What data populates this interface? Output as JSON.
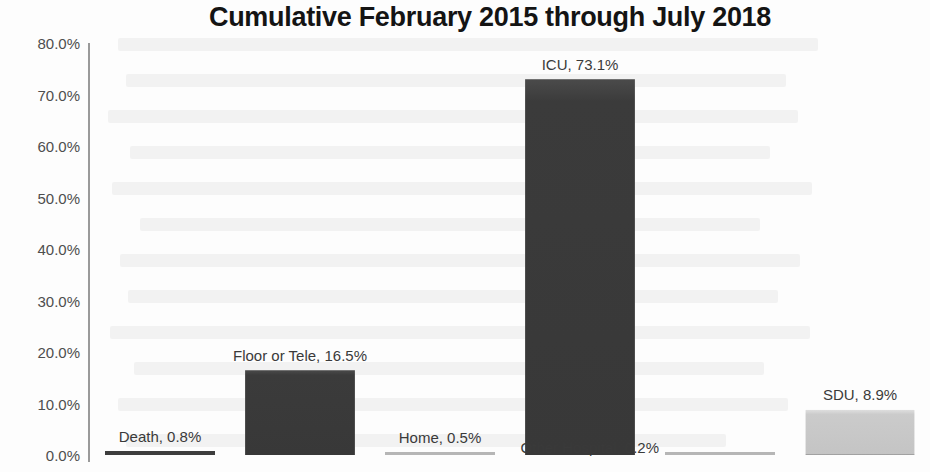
{
  "chart_data": {
    "type": "bar",
    "title": "Cumulative February 2015 through July 2018",
    "xlabel": "",
    "ylabel": "",
    "ylim": [
      0,
      80
    ],
    "grid": false,
    "legend": "none",
    "y_tick_labels": [
      "0.0%",
      "10.0%",
      "20.0%",
      "30.0%",
      "40.0%",
      "50.0%",
      "60.0%",
      "70.0%",
      "80.0%"
    ],
    "y_tick_values": [
      0,
      10,
      20,
      30,
      40,
      50,
      60,
      70,
      80
    ],
    "categories": [
      "Death",
      "Floor or Tele",
      "Home",
      "ICU",
      "Other Hospital",
      "SDU"
    ],
    "values": [
      0.8,
      16.5,
      0.5,
      73.1,
      0.2,
      8.9
    ],
    "data_labels": [
      "Death, 0.8%",
      "Floor or Tele, 16.5%",
      "Home, 0.5%",
      "ICU, 73.1%",
      "Other Hospital, 0.2%",
      "SDU, 8.9%"
    ],
    "bar_colors": [
      "#3d3d3d",
      "#383838",
      "#b6b6b6",
      "#383838",
      "#b6b6b6",
      "#c4c4c4"
    ],
    "bars": [
      {
        "category": "Death",
        "value": 0.8,
        "label": "Death, 0.8%",
        "style": "hairline-dark",
        "label_position": "above"
      },
      {
        "category": "Floor or Tele",
        "value": 16.5,
        "label": "Floor or Tele, 16.5%",
        "style": "dark",
        "label_position": "above"
      },
      {
        "category": "Home",
        "value": 0.5,
        "label": "Home, 0.5%",
        "style": "hairline-faint",
        "label_position": "above"
      },
      {
        "category": "ICU",
        "value": 73.1,
        "label": "ICU, 73.1%",
        "style": "dark",
        "label_position": "above"
      },
      {
        "category": "Other Hospital",
        "value": 0.2,
        "label": "Other Hospital, 0.2%",
        "style": "hairline-faint",
        "label_position": "side"
      },
      {
        "category": "SDU",
        "value": 8.9,
        "label": "SDU, 8.9%",
        "style": "light",
        "label_position": "above"
      }
    ]
  },
  "colors": {
    "background": "#fdfdfd",
    "axis": "#9a9a9a",
    "tick_text": "#4e4e4e",
    "title_text": "#141414",
    "bar_dark": "#383838",
    "bar_light": "#c4c4c4"
  }
}
